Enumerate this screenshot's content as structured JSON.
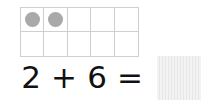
{
  "ten_frame": {
    "rows": 2,
    "cols": 5,
    "filled": [
      true,
      true,
      false,
      false,
      false,
      false,
      false,
      false,
      false,
      false
    ],
    "counter_color": "#a9a9a9"
  },
  "equation": {
    "a": "2",
    "op": "+",
    "b": "6",
    "eq": "=",
    "answer": ""
  }
}
